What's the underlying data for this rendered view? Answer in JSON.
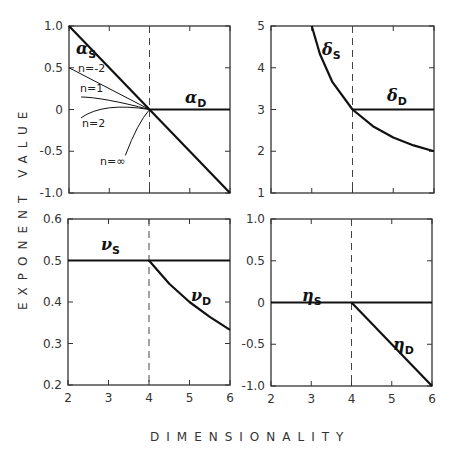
{
  "figure": {
    "ylabel": "EXPONENT VALUE",
    "xlabel": "DIMENSIONALITY"
  },
  "chart_data": [
    {
      "type": "line",
      "panel": "top-left",
      "title": "",
      "xlabel": "DIMENSIONALITY",
      "ylabel": "EXPONENT VALUE",
      "xlim": [
        2,
        6
      ],
      "ylim": [
        -1.0,
        1.0
      ],
      "xticks": [
        2,
        3,
        4,
        5,
        6
      ],
      "yticks": [
        "1.0",
        "0.5",
        "0",
        "-0.5",
        "-1.0"
      ],
      "vline_dashed": 4,
      "series": [
        {
          "name": "alpha_S",
          "label": "α",
          "sub": "S",
          "x": [
            2,
            4,
            6
          ],
          "y": [
            1.0,
            0.0,
            -1.0
          ]
        },
        {
          "name": "alpha_D",
          "label": "α",
          "sub": "D",
          "x": [
            4,
            6
          ],
          "y": [
            0.0,
            0.0
          ]
        },
        {
          "name": "n=-2",
          "x": [
            2,
            4
          ],
          "y": [
            0.5,
            0.0
          ]
        },
        {
          "name": "n=1",
          "x": [
            2.3,
            3.0,
            4
          ],
          "y": [
            0.15,
            0.11,
            0.0
          ]
        },
        {
          "name": "n=2",
          "x": [
            2.3,
            3.0,
            4
          ],
          "y": [
            -0.1,
            0.02,
            0.0
          ]
        },
        {
          "name": "n=∞",
          "x": [
            3.4,
            3.7,
            4
          ],
          "y": [
            -0.55,
            -0.22,
            0.0
          ]
        }
      ],
      "annotations": [
        "n=-2",
        "n=1",
        "n=2",
        "n=∞"
      ]
    },
    {
      "type": "line",
      "panel": "top-right",
      "xlim": [
        2,
        6
      ],
      "ylim": [
        1,
        5
      ],
      "xticks": [
        2,
        3,
        4,
        5,
        6
      ],
      "yticks": [
        "5",
        "4",
        "3",
        "2",
        "1"
      ],
      "vline_dashed": 4,
      "series": [
        {
          "name": "delta_S",
          "label": "δ",
          "sub": "S",
          "x": [
            3.0,
            3.2,
            3.5,
            4.0,
            4.5,
            5.0,
            5.5,
            6.0
          ],
          "y": [
            5.0,
            4.33,
            3.67,
            3.0,
            2.6,
            2.33,
            2.14,
            2.0
          ]
        },
        {
          "name": "delta_D",
          "label": "δ",
          "sub": "D",
          "x": [
            4,
            6
          ],
          "y": [
            3.0,
            3.0
          ]
        }
      ]
    },
    {
      "type": "line",
      "panel": "bottom-left",
      "xlim": [
        2,
        6
      ],
      "ylim": [
        0.2,
        0.6
      ],
      "xticks": [
        2,
        3,
        4,
        5,
        6
      ],
      "yticks": [
        "0.6",
        "0.5",
        "0.4",
        "0.3",
        "0.2"
      ],
      "vline_dashed": 4,
      "series": [
        {
          "name": "nu_S",
          "label": "ν",
          "sub": "S",
          "x": [
            2,
            6
          ],
          "y": [
            0.5,
            0.5
          ]
        },
        {
          "name": "nu_D",
          "label": "ν",
          "sub": "D",
          "x": [
            4.0,
            4.5,
            5.0,
            5.5,
            6.0
          ],
          "y": [
            0.5,
            0.444,
            0.4,
            0.364,
            0.333
          ]
        }
      ]
    },
    {
      "type": "line",
      "panel": "bottom-right",
      "xlim": [
        2,
        6
      ],
      "ylim": [
        -1.0,
        1.0
      ],
      "xticks": [
        2,
        3,
        4,
        5,
        6
      ],
      "yticks": [
        "1.0",
        "0.5",
        "0",
        "-0.5",
        "-1.0"
      ],
      "vline_dashed": 4,
      "series": [
        {
          "name": "eta_S",
          "label": "η",
          "sub": "S",
          "x": [
            2,
            6
          ],
          "y": [
            0.0,
            0.0
          ]
        },
        {
          "name": "eta_D",
          "label": "η",
          "sub": "D",
          "x": [
            4,
            6
          ],
          "y": [
            0.0,
            -1.0
          ]
        }
      ]
    }
  ]
}
